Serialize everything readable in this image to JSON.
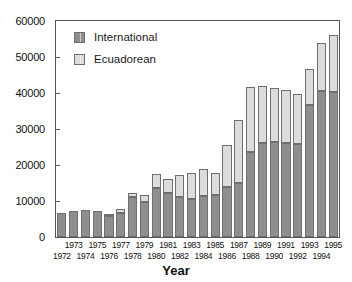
{
  "chart_data": {
    "type": "bar",
    "subtype": "stacked",
    "title": "",
    "xlabel": "Year",
    "ylabel": "",
    "ylim": [
      0,
      60000
    ],
    "ytick_labels": [
      "0",
      "10000",
      "20000",
      "30000",
      "40000",
      "50000",
      "60000"
    ],
    "ytick_values": [
      0,
      10000,
      20000,
      30000,
      40000,
      50000,
      60000
    ],
    "grid": false,
    "legend_position": "top-left",
    "categories": [
      "1972",
      "1973",
      "1974",
      "1975",
      "1976",
      "1977",
      "1978",
      "1979",
      "1980",
      "1981",
      "1982",
      "1983",
      "1984",
      "1985",
      "1986",
      "1987",
      "1988",
      "1989",
      "1990",
      "1991",
      "1992",
      "1993",
      "1994",
      "1995"
    ],
    "series": [
      {
        "name": "International",
        "color": "#8e8e8e",
        "values": [
          6800,
          7200,
          7500,
          7200,
          5900,
          6800,
          11000,
          9700,
          13500,
          12300,
          11100,
          10500,
          11300,
          11600,
          14000,
          15000,
          23500,
          26200,
          26300,
          26000,
          25900,
          36800,
          40600,
          40400
        ]
      },
      {
        "name": "Ecuadorean",
        "color": "#dcdcdc",
        "values": [
          0,
          0,
          0,
          0,
          300,
          1100,
          1300,
          1900,
          3900,
          3900,
          6100,
          7200,
          7500,
          6300,
          11700,
          17500,
          18200,
          15800,
          15000,
          14800,
          13800,
          10000,
          13300,
          15600
        ]
      }
    ],
    "totals": [
      6800,
      7200,
      7500,
      7200,
      6200,
      7900,
      12300,
      11600,
      17400,
      16200,
      17200,
      17700,
      18800,
      17900,
      25700,
      32500,
      41700,
      42000,
      41300,
      40800,
      39700,
      46800,
      53900,
      56000
    ]
  },
  "legend": {
    "items": [
      {
        "label": "International",
        "swatch": "dark-gray-swatch"
      },
      {
        "label": "Ecuadorean",
        "swatch": "light-gray-swatch"
      }
    ]
  },
  "axis": {
    "x_title": "Year"
  }
}
